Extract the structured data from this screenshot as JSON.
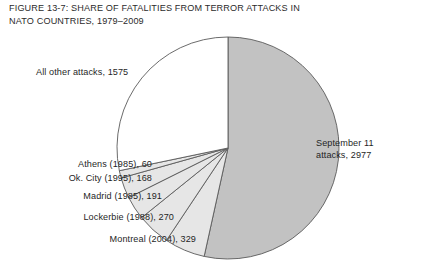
{
  "figure": {
    "title_line1": "FIGURE 13-7: SHARE OF FATALITIES FROM TERROR ATTACKS IN",
    "title_line2": "NATO COUNTRIES, 1979–2009"
  },
  "labels": {
    "all_other": "All other attacks, 1575",
    "athens": "Athens (1985), 60",
    "okcity": "Ok. City (1995), 168",
    "madrid": "Madrid (1985), 191",
    "lockerbie": "Lockerbie (1988), 270",
    "montreal": "Montreal (2004), 329",
    "sept11_line1": "September 11",
    "sept11_line2": "attacks, 2977"
  },
  "colors": {
    "slice_large_gray": "#c2c2c2",
    "slice_light_gray": "#e6e6e6",
    "slice_white": "#ffffff",
    "outline": "#5a5a5a",
    "text": "#1f1f1f",
    "background": "#ffffff"
  },
  "chart_data": {
    "type": "pie",
    "title": "FIGURE 13-7: SHARE OF FATALITIES FROM TERROR ATTACKS IN NATO COUNTRIES, 1979–2009",
    "xlabel": "",
    "ylabel": "",
    "legend_position": "none",
    "grid": false,
    "unit": "fatalities",
    "total": 5570,
    "start_angle_deg": 0,
    "direction": "clockwise",
    "categories": [
      "September 11 attacks",
      "Montreal (2004)",
      "Lockerbie (1988)",
      "Madrid (1985)",
      "Ok. City (1995)",
      "Athens (1985)",
      "All other attacks"
    ],
    "values": [
      2977,
      329,
      270,
      191,
      168,
      60,
      1575
    ],
    "slices": [
      {
        "label": "September 11 attacks, 2977",
        "name": "September 11 attacks",
        "year": 2001,
        "value": 2977,
        "percent": 53.4,
        "fill": "#c2c2c2"
      },
      {
        "label": "Montreal (2004), 329",
        "name": "Montreal",
        "year": 2004,
        "value": 329,
        "percent": 5.9,
        "fill": "#e6e6e6"
      },
      {
        "label": "Lockerbie (1988), 270",
        "name": "Lockerbie",
        "year": 1988,
        "value": 270,
        "percent": 4.8,
        "fill": "#e6e6e6"
      },
      {
        "label": "Madrid (1985), 191",
        "name": "Madrid",
        "year": 1985,
        "value": 191,
        "percent": 3.4,
        "fill": "#e6e6e6"
      },
      {
        "label": "Ok. City (1995), 168",
        "name": "Ok. City",
        "year": 1995,
        "value": 168,
        "percent": 3.0,
        "fill": "#e6e6e6"
      },
      {
        "label": "Athens (1985), 60",
        "name": "Athens",
        "year": 1985,
        "value": 60,
        "percent": 1.1,
        "fill": "#e6e6e6"
      },
      {
        "label": "All other attacks, 1575",
        "name": "All other attacks",
        "value": 1575,
        "percent": 28.3,
        "fill": "#ffffff"
      }
    ]
  }
}
